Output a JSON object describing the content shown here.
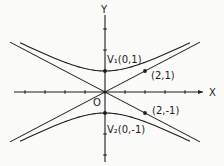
{
  "diagram": {
    "type": "hyperbola",
    "equation": "y^2 - x^2/4 = 1",
    "axes": {
      "x_label": "X",
      "y_label": "Y",
      "x_ticks": [
        -4,
        -3,
        -2,
        -1,
        1,
        2,
        3,
        4
      ],
      "y_ticks": [
        -3,
        -2,
        -1,
        1,
        2,
        3
      ]
    },
    "origin_label": "O",
    "asymptotes": [
      {
        "name": "asymptote-positive",
        "slope": 0.5
      },
      {
        "name": "asymptote-negative",
        "slope": -0.5
      }
    ],
    "points": [
      {
        "name": "vertex-1",
        "label": "V₁(0,1)",
        "x": 0,
        "y": 1
      },
      {
        "name": "vertex-2",
        "label": "V₂(0,-1)",
        "x": 0,
        "y": -1
      },
      {
        "name": "asymptote-point-upper",
        "label": "(2,1)",
        "x": 2,
        "y": 1
      },
      {
        "name": "asymptote-point-lower",
        "label": "(2,-1)",
        "x": 2,
        "y": -1
      }
    ],
    "colors": {
      "ink": "#1e1e1e",
      "paper": "#fbfbf9"
    }
  }
}
